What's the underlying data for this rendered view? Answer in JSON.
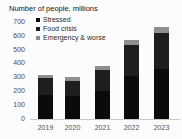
{
  "title": "Number of people, millions",
  "colors": {
    "background": "#fcfcfc",
    "title_text": "#161616",
    "axis_text": "#4a4a4a",
    "baseline": "#c9c9c9",
    "stressed": "#0b0b0b",
    "food_crisis": "#1e1e1e",
    "emergency_worse": "#8f8f8f"
  },
  "chart_data": {
    "type": "bar",
    "stacked": true,
    "title": "Number of people, millions",
    "categories": [
      "2019",
      "2020",
      "2021",
      "2022",
      "2023"
    ],
    "series": [
      {
        "name": "Stressed",
        "color": "#0b0b0b",
        "values": [
          175,
          165,
          205,
          310,
          360
        ]
      },
      {
        "name": "Food crisis",
        "color": "#1e1e1e",
        "values": [
          120,
          110,
          145,
          225,
          260
        ]
      },
      {
        "name": "Emergency & worse",
        "color": "#8f8f8f",
        "values": [
          25,
          25,
          30,
          35,
          40
        ]
      }
    ],
    "xlabel": "",
    "ylabel": "",
    "ylim": [
      0,
      700
    ],
    "yticks": [
      0,
      100,
      200,
      300,
      400,
      500,
      600,
      700
    ],
    "grid": false,
    "legend_position": "top-left"
  }
}
